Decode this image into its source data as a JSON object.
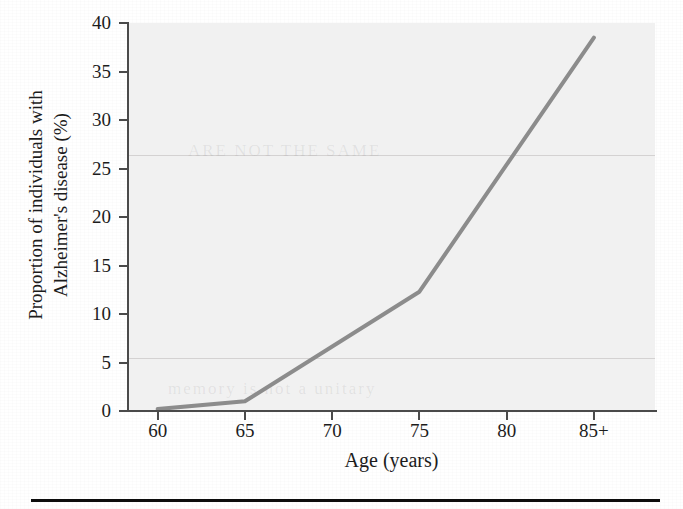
{
  "figure": {
    "background_color": "#ffffff",
    "plot_background_color": "#f1f1f1",
    "axis_color": "#4a4a4a",
    "line_color": "#8c8c8c",
    "bottom_rule_color": "#0d0d0d"
  },
  "chart_data": {
    "type": "line",
    "title": "",
    "xlabel": "Age (years)",
    "ylabel": "Proportion of individuals with Alzheimer's disease (%)",
    "ylabel_line1": "Proportion of individuals with",
    "ylabel_line2": "Alzheimer's disease (%)",
    "categories": [
      "60",
      "65",
      "70",
      "75",
      "80",
      "85+"
    ],
    "x": [
      60,
      65,
      70,
      75,
      80,
      85
    ],
    "values": [
      0.2,
      1.0,
      6.4,
      12.3,
      24.9,
      38.5
    ],
    "series": [
      {
        "name": "Proportion with Alzheimer's disease",
        "values": [
          0.2,
          1.0,
          6.4,
          12.3,
          24.9,
          38.5
        ]
      }
    ],
    "vertices": [
      {
        "x": 60,
        "y": 0.2
      },
      {
        "x": 65,
        "y": 1.0
      },
      {
        "x": 75,
        "y": 12.3
      },
      {
        "x": 85,
        "y": 38.5
      }
    ],
    "xlim": [
      58.3,
      88.5
    ],
    "ylim": [
      0,
      40
    ],
    "xticks": [
      60,
      65,
      70,
      75,
      80,
      85
    ],
    "xticklabels": [
      "60",
      "65",
      "70",
      "75",
      "80",
      "85+"
    ],
    "yticks": [
      0,
      5,
      10,
      15,
      20,
      25,
      30,
      35,
      40
    ],
    "yticklabels": [
      "0",
      "5",
      "10",
      "15",
      "20",
      "25",
      "30",
      "35",
      "40"
    ],
    "grid": false,
    "legend": false,
    "legend_position": "none",
    "line_width_px": 4,
    "annotations": []
  },
  "artifacts": {
    "ghost_text_upper": "ARE NOT THE SAME",
    "ghost_text_lower": "memory is not a unitary"
  }
}
